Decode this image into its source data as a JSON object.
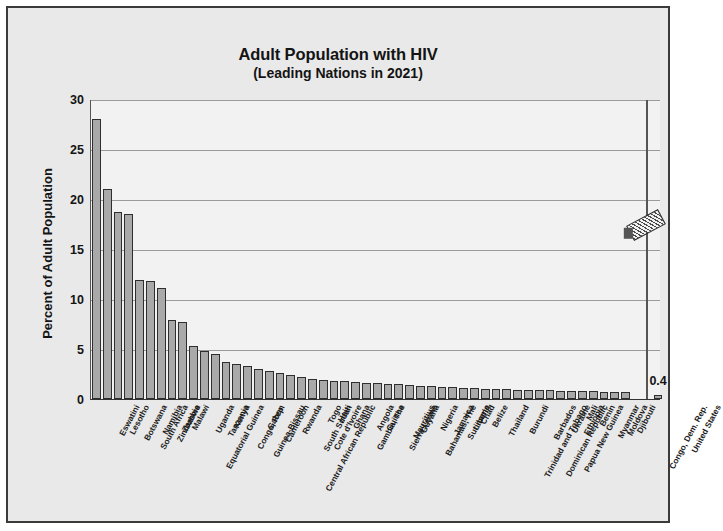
{
  "chart_data": {
    "type": "bar",
    "title": "Adult Population with HIV",
    "subtitle": "(Leading Nations in 2021)",
    "xlabel": "",
    "ylabel": "Percent of Adult Population",
    "ylim": [
      0,
      30
    ],
    "yticks": [
      0,
      5,
      10,
      15,
      20,
      25,
      30
    ],
    "grid": true,
    "legend": "none",
    "axis_break": true,
    "categories": [
      "Eswatini",
      "Lesotho",
      "Botswana",
      "South Africa",
      "Namibia",
      "Zimbabwe",
      "Zambia",
      "Malawi",
      "Equatorial Guinea",
      "Uganda",
      "Tanzania",
      "Kenya",
      "Congo, Rep.",
      "Guinea-Bissau",
      "Gabon",
      "Cameroon",
      "Central African Republic",
      "Rwanda",
      "South Sudan",
      "Cote d'Ivoire",
      "Togo",
      "Haiti",
      "Ghana",
      "Gambia, The",
      "Angola",
      "Guinea",
      "Sierra Leone",
      "Mauritius",
      "Guyana",
      "Bahamas, The",
      "Nigeria",
      "Jamaica",
      "Suriname",
      "Liberia",
      "Chad",
      "Belize",
      "Thailand",
      "Trinidad and Tobago",
      "Burundi",
      "Dominican Republic",
      "Barbados",
      "Papua New Guinea",
      "Ukraine",
      "Ethiopia",
      "Mali",
      "Benin",
      "Myanmar",
      "Moldova",
      "Djibouti",
      "Congo, Dem. Rep."
    ],
    "values": [
      28.0,
      21.0,
      18.7,
      18.5,
      11.9,
      11.8,
      11.1,
      7.9,
      7.7,
      5.3,
      4.8,
      4.5,
      3.7,
      3.5,
      3.3,
      3.0,
      2.8,
      2.6,
      2.4,
      2.2,
      2.0,
      1.9,
      1.8,
      1.8,
      1.7,
      1.6,
      1.6,
      1.5,
      1.5,
      1.4,
      1.3,
      1.3,
      1.2,
      1.2,
      1.1,
      1.1,
      1.0,
      1.0,
      1.0,
      0.9,
      0.9,
      0.9,
      0.9,
      0.8,
      0.8,
      0.8,
      0.8,
      0.7,
      0.7,
      0.7
    ],
    "separated_categories": [
      "United States"
    ],
    "separated_values": [
      0.4
    ],
    "separated_value_labels": [
      "0.4"
    ]
  },
  "meta": {
    "bar_fill": "#a9a9a9",
    "bar_edge": "#2e2e2e",
    "frame_background": "#e9e9e9",
    "plot_background": "#f2f2f2",
    "gridline_color": "#9b9b9b",
    "text_color": "#141414"
  }
}
